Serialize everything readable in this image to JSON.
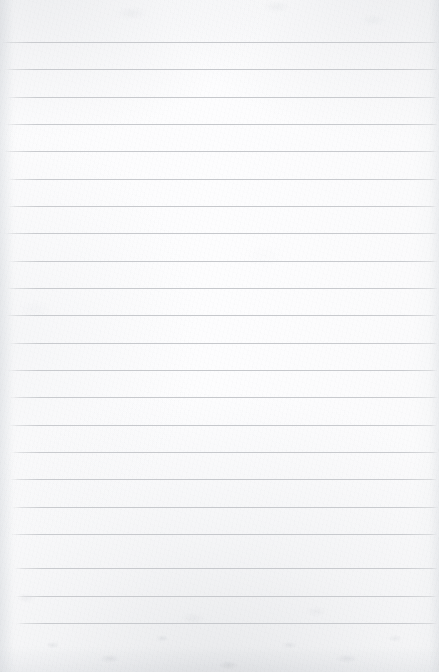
{
  "document": {
    "kind": "scanned-lined-notebook-paper",
    "orientation": "portrait",
    "page_width": 439,
    "page_height": 672,
    "background_color": "#fbfbfc",
    "rule_color": "#c6c8cc",
    "has_visible_text": false,
    "written_content": "",
    "header_text": "",
    "footer_text": "",
    "page_number_text": ""
  },
  "ruling": {
    "line_count": 22,
    "first_line_y": 42,
    "line_spacing": 27.4,
    "line_thickness": 1,
    "left_margin_x": 8,
    "right_edge_x": 437,
    "top_blank_margin": 42,
    "bottom_blank_margin": 49,
    "has_vertical_margin_rule": false,
    "lines": [
      {
        "index": 1,
        "y": 42,
        "left": 2,
        "right": 438
      },
      {
        "index": 2,
        "y": 69,
        "left": 5,
        "right": 438
      },
      {
        "index": 3,
        "y": 97,
        "left": 7,
        "right": 437
      },
      {
        "index": 4,
        "y": 124,
        "left": 6,
        "right": 438
      },
      {
        "index": 5,
        "y": 151,
        "left": 4,
        "right": 437
      },
      {
        "index": 6,
        "y": 179,
        "left": 8,
        "right": 438
      },
      {
        "index": 7,
        "y": 206,
        "left": 7,
        "right": 437
      },
      {
        "index": 8,
        "y": 233,
        "left": 5,
        "right": 438
      },
      {
        "index": 9,
        "y": 261,
        "left": 9,
        "right": 437
      },
      {
        "index": 10,
        "y": 288,
        "left": 7,
        "right": 438
      },
      {
        "index": 11,
        "y": 315,
        "left": 6,
        "right": 437
      },
      {
        "index": 12,
        "y": 343,
        "left": 9,
        "right": 438
      },
      {
        "index": 13,
        "y": 370,
        "left": 8,
        "right": 437
      },
      {
        "index": 14,
        "y": 397,
        "left": 10,
        "right": 438
      },
      {
        "index": 15,
        "y": 425,
        "left": 9,
        "right": 437
      },
      {
        "index": 16,
        "y": 452,
        "left": 11,
        "right": 438
      },
      {
        "index": 17,
        "y": 479,
        "left": 10,
        "right": 437
      },
      {
        "index": 18,
        "y": 507,
        "left": 12,
        "right": 438
      },
      {
        "index": 19,
        "y": 534,
        "left": 11,
        "right": 437
      },
      {
        "index": 20,
        "y": 568,
        "left": 14,
        "right": 438
      },
      {
        "index": 21,
        "y": 596,
        "left": 15,
        "right": 437
      },
      {
        "index": 22,
        "y": 623,
        "left": 16,
        "right": 437
      }
    ]
  },
  "texture": {
    "description": "mottled grey scanner speckle, strongest along bottom edge and upper corners",
    "speckle_tone": "#b8bcc2",
    "edge_shadow_tone": "#dee0e4"
  }
}
